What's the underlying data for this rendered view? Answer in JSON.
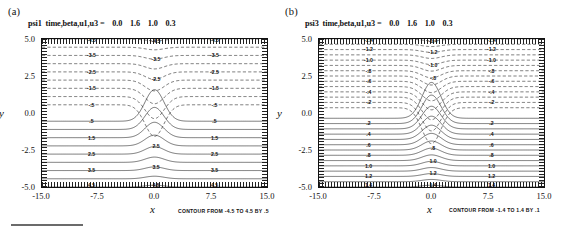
{
  "figure": {
    "bottom_rule": "horizontal-rule"
  },
  "panels": [
    {
      "key": "a",
      "label": "(a)",
      "title": "psi1  time,beta,u1,u3 =    0.0    1.6    1.0    0.3",
      "variable": "psi1",
      "param_names": "time,beta,u1,u3",
      "param_values": [
        0.0,
        1.6,
        1.0,
        0.3
      ],
      "contour_caption": "CONTOUR FROM -4.5 TO 4.5 BY .5",
      "xlabel": "x",
      "ylabel": "y",
      "xticks": [
        "-15.0",
        "-7.5",
        "0.0",
        "7.5",
        "15.0"
      ],
      "yticks": [
        "5.0",
        "2.5",
        "0.0",
        "-2.5",
        "-5.0"
      ]
    },
    {
      "key": "b",
      "label": "(b)",
      "title": "psi3  time,beta,u1,u3 =    0.0    1.6    1.0    0.3",
      "variable": "psi3",
      "param_names": "time,beta,u1,u3",
      "param_values": [
        0.0,
        1.6,
        1.0,
        0.3
      ],
      "contour_caption": "CONTOUR FROM -1.4 TO 1.4 BY .1",
      "xlabel": "x",
      "ylabel": "y",
      "xticks": [
        "-15.0",
        "-7.5",
        "0.0",
        "7.5",
        "15.0"
      ],
      "yticks": [
        "5.0",
        "2.5",
        "0.0",
        "-2.5",
        "-5.0"
      ]
    }
  ],
  "chart_data": [
    {
      "type": "contour",
      "panel": "a",
      "title": "psi1  time,beta,u1,u3 =    0.0    1.6    1.0    0.3",
      "xlabel": "x",
      "ylabel": "y",
      "xlim": [
        -15.0,
        15.0
      ],
      "ylim": [
        -5.0,
        5.0
      ],
      "xticks": [
        -15.0,
        -7.5,
        0.0,
        7.5,
        15.0
      ],
      "yticks": [
        -5.0,
        -2.5,
        0.0,
        2.5,
        5.0
      ],
      "grid": false,
      "legend": "none",
      "contour_min": -4.5,
      "contour_max": 4.5,
      "contour_interval": 0.5,
      "levels": [
        -4.5,
        -4.0,
        -3.5,
        -3.0,
        -2.5,
        -2.0,
        -1.5,
        -1.0,
        -0.5,
        0.5,
        1.0,
        1.5,
        2.0,
        2.5,
        3.0,
        3.5,
        4.0,
        4.5
      ],
      "labeled_levels_negative": [
        "-4.5",
        "-3.5",
        "-2.5",
        "-1.5",
        "-.5"
      ],
      "labeled_levels_positive": [
        ".5",
        "1.5",
        "2.5",
        "3.5",
        "4.5"
      ],
      "negative_line_style": "dashed",
      "positive_line_style": "solid",
      "zero_contour_drawn": false,
      "symmetry": "antisymmetric about y = 0",
      "description": "Streamfunction psi1: near-zonal contours far from center, deflected into a sharp cusp/trough at x = 0 where contours converge; negative (dashed) values in the upper half plane, positive (solid) in the lower half plane."
    },
    {
      "type": "contour",
      "panel": "b",
      "title": "psi3  time,beta,u1,u3 =    0.0    1.6    1.0    0.3",
      "xlabel": "x",
      "ylabel": "y",
      "xlim": [
        -15.0,
        15.0
      ],
      "ylim": [
        -5.0,
        5.0
      ],
      "xticks": [
        -15.0,
        -7.5,
        0.0,
        7.5,
        15.0
      ],
      "yticks": [
        -5.0,
        -2.5,
        0.0,
        2.5,
        5.0
      ],
      "grid": false,
      "legend": "none",
      "contour_min": -1.4,
      "contour_max": 1.4,
      "contour_interval": 0.1,
      "levels": [
        -1.4,
        -1.3,
        -1.2,
        -1.1,
        -1.0,
        -0.9,
        -0.8,
        -0.7,
        -0.6,
        -0.5,
        -0.4,
        -0.3,
        -0.2,
        -0.1,
        0.1,
        0.2,
        0.3,
        0.4,
        0.5,
        0.6,
        0.7,
        0.8,
        0.9,
        1.0,
        1.1,
        1.2,
        1.3,
        1.4
      ],
      "labeled_levels_negative": [
        "-1.4",
        "-1.2",
        "-1.0",
        "-.8",
        "-.6",
        "-.4",
        "-.2"
      ],
      "labeled_levels_positive": [
        ".2",
        ".4",
        ".6",
        ".8",
        "1.0",
        "1.2",
        "1.4"
      ],
      "negative_line_style": "dashed",
      "positive_line_style": "solid",
      "zero_contour_drawn": false,
      "symmetry": "antisymmetric about y = 0",
      "description": "Streamfunction psi3: same geometry as psi1 but with a finer contour interval, producing a denser family of lines with a broader, rounded bump at x = 0 in the lower half plane."
    }
  ]
}
